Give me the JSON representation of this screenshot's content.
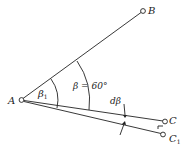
{
  "diagram": {
    "points": {
      "A": {
        "label": "A",
        "x": 21,
        "y": 100
      },
      "B": {
        "label": "B",
        "x": 143,
        "y": 11
      },
      "C": {
        "label": "C",
        "x": 165,
        "y": 121
      },
      "C1": {
        "label": "C",
        "sub": "1",
        "x": 163,
        "y": 134
      }
    },
    "angles": {
      "beta1": {
        "symbol": "β",
        "sub": "1"
      },
      "beta": {
        "text": "β = 60°"
      },
      "dbeta": {
        "text": "dβ"
      }
    },
    "colors": {
      "stroke": "#222222",
      "background": "#ffffff"
    }
  }
}
